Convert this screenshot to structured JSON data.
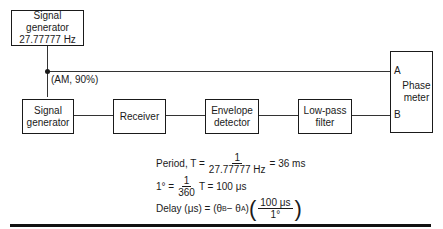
{
  "blocks": {
    "top_generator": "Signal generator\n27.77777 Hz",
    "signal_generator": "Signal\ngenerator",
    "receiver": "Receiver",
    "envelope_detector": "Envelope\ndetector",
    "low_pass_filter": "Low-pass\nfilter",
    "phase_meter": "Phase\nmeter"
  },
  "labels": {
    "modulation": "(AM, 90%)",
    "input_a": "A",
    "input_b": "B"
  },
  "equations": {
    "period_prefix": "Period, T =",
    "period_num": "1",
    "period_den": "27.77777 Hz",
    "period_result": "= 36 ms",
    "degree_prefix": "1° =",
    "degree_num": "1",
    "degree_den": "360",
    "degree_result": "T = 100 μs",
    "delay_prefix": "Delay (μs) = (θ",
    "delay_sub_b": "B",
    "delay_minus": " − θ",
    "delay_sub_a": "A",
    "delay_close": ")",
    "delay_num": "100 μs",
    "delay_den": "1°"
  },
  "colors": {
    "ink": "#1a1a1a",
    "background": "#ffffff"
  }
}
